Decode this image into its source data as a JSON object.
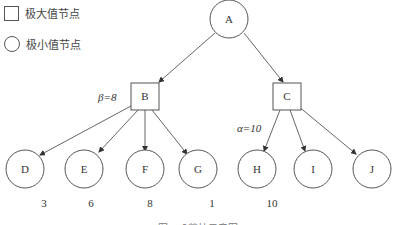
{
  "legend": {
    "max_node_label": "极大值节点",
    "min_node_label": "极小值节点"
  },
  "nodes": {
    "A": {
      "label": "A",
      "shape": "circle"
    },
    "B": {
      "label": "B",
      "shape": "square"
    },
    "C": {
      "label": "C",
      "shape": "square"
    },
    "D": {
      "label": "D",
      "shape": "circle",
      "value": "3"
    },
    "E": {
      "label": "E",
      "shape": "circle",
      "value": "6"
    },
    "F": {
      "label": "F",
      "shape": "circle",
      "value": "8"
    },
    "G": {
      "label": "G",
      "shape": "circle",
      "value": "1"
    },
    "H": {
      "label": "H",
      "shape": "circle",
      "value": "10"
    },
    "I": {
      "label": "I",
      "shape": "circle"
    },
    "J": {
      "label": "J",
      "shape": "circle"
    }
  },
  "annotations": {
    "beta": "β=8",
    "alpha": "α=10"
  },
  "caption": "图 α-β剪枝示意图",
  "colors": {
    "stroke": "#555555",
    "text": "#333333",
    "background": "#ffffff"
  }
}
